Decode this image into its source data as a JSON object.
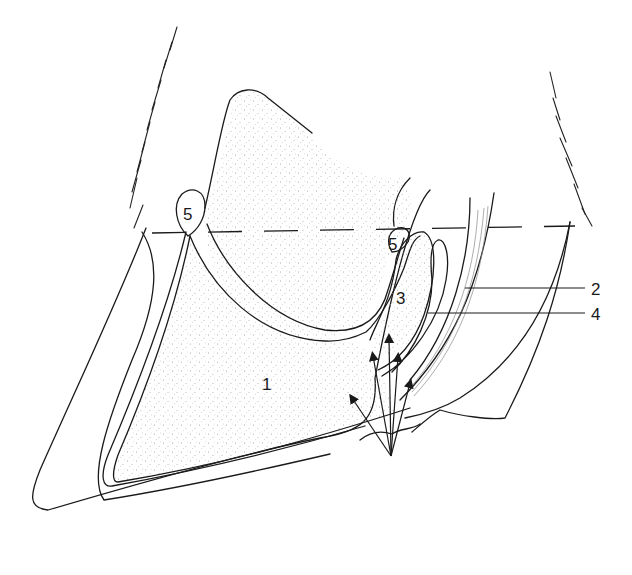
{
  "figure": {
    "labels": [
      {
        "id": "label-1",
        "text": "1"
      },
      {
        "id": "label-2",
        "text": "2"
      },
      {
        "id": "label-3",
        "text": "3"
      },
      {
        "id": "label-4",
        "text": "4"
      },
      {
        "id": "label-5a",
        "text": "5"
      },
      {
        "id": "label-5b",
        "text": "5"
      }
    ],
    "arrow_count": 5,
    "colors": {
      "line": "#1a1a1a",
      "stipple": "#9a9a9a",
      "background": "#ffffff"
    }
  }
}
